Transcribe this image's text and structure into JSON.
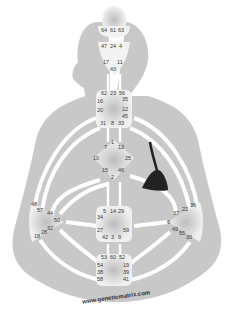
{
  "colors": {
    "body_silhouette": "#c8c8c8",
    "channel": "#ffffff",
    "center_fill": "#e6e6e6",
    "center_glow": "#bdbdbd",
    "gate_text": "#3a3a3a",
    "pendulum": "#222222",
    "background": "#ffffff"
  },
  "centers": {
    "head": {
      "gates": [
        "64",
        "61",
        "63"
      ]
    },
    "ajna": {
      "gates": [
        "47",
        "24",
        "4",
        "17",
        "11",
        "43"
      ]
    },
    "throat": {
      "gates": [
        "62",
        "23",
        "56",
        "16",
        "35",
        "20",
        "12",
        "45",
        "31",
        "8",
        "33"
      ]
    },
    "g_center": {
      "gates": [
        "1",
        "7",
        "13",
        "10",
        "25",
        "15",
        "46",
        "2"
      ]
    },
    "sacral": {
      "gates": [
        "5",
        "14",
        "29",
        "34",
        "27",
        "59",
        "42",
        "3",
        "9"
      ]
    },
    "root": {
      "gates": [
        "53",
        "60",
        "52",
        "54",
        "19",
        "38",
        "39",
        "58",
        "41"
      ]
    },
    "spleen": {
      "gates": [
        "48",
        "57",
        "44",
        "50",
        "32",
        "28",
        "18"
      ]
    },
    "solar_plexus": {
      "gates": [
        "36",
        "22",
        "37",
        "6",
        "49",
        "55",
        "30"
      ]
    },
    "heart": {
      "gates": [
        "21",
        "51",
        "26",
        "40"
      ]
    }
  },
  "gate_labels": [
    {
      "id": "64",
      "x": 104,
      "y": 31
    },
    {
      "id": "61",
      "x": 113,
      "y": 31
    },
    {
      "id": "63",
      "x": 121,
      "y": 31
    },
    {
      "id": "47",
      "x": 104,
      "y": 47
    },
    {
      "id": "24",
      "x": 113,
      "y": 47
    },
    {
      "id": "4",
      "x": 122,
      "y": 47
    },
    {
      "id": "17",
      "x": 106,
      "y": 63
    },
    {
      "id": "11",
      "x": 120,
      "y": 63
    },
    {
      "id": "43",
      "x": 113,
      "y": 70
    },
    {
      "id": "62",
      "x": 104,
      "y": 94
    },
    {
      "id": "23",
      "x": 113,
      "y": 94
    },
    {
      "id": "56",
      "x": 122,
      "y": 94
    },
    {
      "id": "16",
      "x": 100,
      "y": 102
    },
    {
      "id": "35",
      "x": 125,
      "y": 100
    },
    {
      "id": "20",
      "x": 100,
      "y": 111
    },
    {
      "id": "12",
      "x": 125,
      "y": 110
    },
    {
      "id": "45",
      "x": 125,
      "y": 117
    },
    {
      "id": "31",
      "x": 103,
      "y": 124
    },
    {
      "id": "8",
      "x": 114,
      "y": 124
    },
    {
      "id": "33",
      "x": 121,
      "y": 124
    },
    {
      "id": "1",
      "x": 114,
      "y": 143
    },
    {
      "id": "7",
      "x": 107,
      "y": 148
    },
    {
      "id": "13",
      "x": 121,
      "y": 148
    },
    {
      "id": "10",
      "x": 96,
      "y": 159
    },
    {
      "id": "25",
      "x": 128,
      "y": 159
    },
    {
      "id": "15",
      "x": 105,
      "y": 171
    },
    {
      "id": "46",
      "x": 121,
      "y": 171
    },
    {
      "id": "2",
      "x": 114,
      "y": 178
    },
    {
      "id": "5",
      "x": 106,
      "y": 212
    },
    {
      "id": "14",
      "x": 113,
      "y": 212
    },
    {
      "id": "29",
      "x": 121,
      "y": 212
    },
    {
      "id": "34",
      "x": 100,
      "y": 218
    },
    {
      "id": "27",
      "x": 100,
      "y": 231
    },
    {
      "id": "59",
      "x": 126,
      "y": 231
    },
    {
      "id": "42",
      "x": 105,
      "y": 238
    },
    {
      "id": "3",
      "x": 114,
      "y": 238
    },
    {
      "id": "9",
      "x": 121,
      "y": 238
    },
    {
      "id": "53",
      "x": 104,
      "y": 258
    },
    {
      "id": "60",
      "x": 113,
      "y": 258
    },
    {
      "id": "52",
      "x": 122,
      "y": 258
    },
    {
      "id": "54",
      "x": 100,
      "y": 266
    },
    {
      "id": "19",
      "x": 126,
      "y": 266
    },
    {
      "id": "38",
      "x": 100,
      "y": 273
    },
    {
      "id": "39",
      "x": 126,
      "y": 273
    },
    {
      "id": "58",
      "x": 100,
      "y": 280
    },
    {
      "id": "41",
      "x": 126,
      "y": 280
    },
    {
      "id": "48",
      "x": 34,
      "y": 205
    },
    {
      "id": "57",
      "x": 40,
      "y": 211
    },
    {
      "id": "44",
      "x": 50,
      "y": 214
    },
    {
      "id": "50",
      "x": 57,
      "y": 221
    },
    {
      "id": "32",
      "x": 50,
      "y": 229
    },
    {
      "id": "28",
      "x": 44,
      "y": 233
    },
    {
      "id": "18",
      "x": 37,
      "y": 237
    },
    {
      "id": "36",
      "x": 193,
      "y": 206
    },
    {
      "id": "22",
      "x": 185,
      "y": 210
    },
    {
      "id": "37",
      "x": 176,
      "y": 214
    },
    {
      "id": "6",
      "x": 170,
      "y": 223
    },
    {
      "id": "49",
      "x": 175,
      "y": 230
    },
    {
      "id": "55",
      "x": 182,
      "y": 234
    },
    {
      "id": "30",
      "x": 189,
      "y": 238
    }
  ],
  "watermark": "www.geneticmatrix.com"
}
